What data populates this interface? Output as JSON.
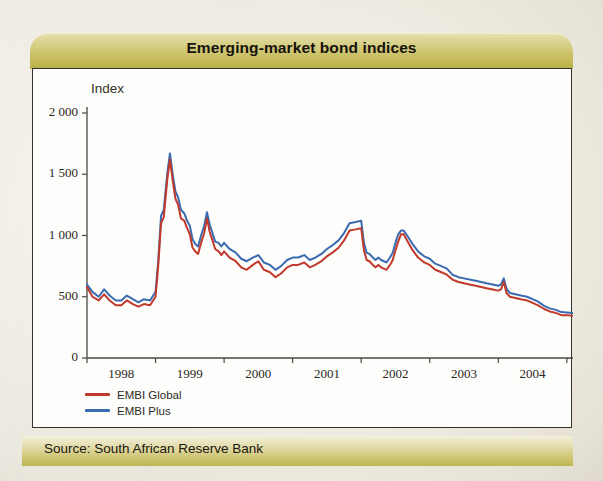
{
  "figure": {
    "title": "Emerging-market bond indices",
    "source": "Source: South African Reserve Bank",
    "index_label": "Index",
    "colors": {
      "title_bar": "#c6bd63",
      "footer_bar": "#d0c678",
      "panel_bg": "#fdfdfb",
      "frame": "#36332b",
      "embi_global": "#c0392b",
      "embi_plus": "#3a6bb0"
    }
  },
  "chart_data": {
    "type": "line",
    "title": "Emerging-market bond indices",
    "xlabel": "",
    "ylabel": "Index",
    "ylim": [
      0,
      2000
    ],
    "yticks": [
      0,
      500,
      1000,
      1500,
      2000
    ],
    "ytick_labels": [
      "0",
      "500",
      "1 000",
      "1 500",
      "2 000"
    ],
    "xlim": [
      1997.58,
      2004.67
    ],
    "xticks": [
      1997.58,
      1998.58,
      1999.58,
      2000.58,
      2001.58,
      2002.58,
      2003.58,
      2004.58
    ],
    "xtick_labels": [
      "1998",
      "1999",
      "2000",
      "2001",
      "2002",
      "2003",
      "2004"
    ],
    "grid": false,
    "legend_position": "bottom-left",
    "series": [
      {
        "name": "EMBI Global",
        "color": "#c0392b",
        "x": [
          1997.58,
          1997.66,
          1997.75,
          1997.83,
          1997.91,
          1998.0,
          1998.08,
          1998.16,
          1998.25,
          1998.33,
          1998.41,
          1998.5,
          1998.58,
          1998.62,
          1998.66,
          1998.7,
          1998.75,
          1998.79,
          1998.83,
          1998.87,
          1998.91,
          1998.95,
          1999.0,
          1999.04,
          1999.08,
          1999.12,
          1999.16,
          1999.2,
          1999.25,
          1999.29,
          1999.33,
          1999.37,
          1999.41,
          1999.45,
          1999.5,
          1999.54,
          1999.58,
          1999.66,
          1999.75,
          1999.83,
          1999.91,
          2000.0,
          2000.08,
          2000.16,
          2000.25,
          2000.33,
          2000.41,
          2000.5,
          2000.58,
          2000.66,
          2000.75,
          2000.83,
          2000.91,
          2001.0,
          2001.08,
          2001.16,
          2001.25,
          2001.33,
          2001.41,
          2001.5,
          2001.58,
          2001.62,
          2001.66,
          2001.7,
          2001.75,
          2001.79,
          2001.83,
          2001.87,
          2001.91,
          2001.95,
          2002.0,
          2002.04,
          2002.08,
          2002.12,
          2002.16,
          2002.2,
          2002.25,
          2002.33,
          2002.41,
          2002.5,
          2002.58,
          2002.66,
          2002.75,
          2002.83,
          2002.91,
          2003.0,
          2003.08,
          2003.16,
          2003.25,
          2003.33,
          2003.41,
          2003.5,
          2003.58,
          2003.62,
          2003.66,
          2003.7,
          2003.75,
          2003.83,
          2003.91,
          2004.0,
          2004.08,
          2004.16,
          2004.25,
          2004.33,
          2004.41,
          2004.5,
          2004.58,
          2004.66
        ],
        "y": [
          580,
          500,
          470,
          520,
          470,
          430,
          430,
          470,
          440,
          420,
          440,
          430,
          500,
          760,
          1100,
          1150,
          1450,
          1620,
          1450,
          1300,
          1250,
          1140,
          1120,
          1060,
          1010,
          900,
          870,
          850,
          950,
          1020,
          1140,
          1030,
          960,
          890,
          870,
          840,
          870,
          820,
          790,
          740,
          720,
          760,
          790,
          720,
          700,
          660,
          690,
          740,
          760,
          760,
          780,
          740,
          760,
          790,
          830,
          860,
          900,
          960,
          1040,
          1050,
          1060,
          880,
          800,
          790,
          760,
          740,
          760,
          740,
          730,
          720,
          760,
          800,
          880,
          950,
          1010,
          1010,
          960,
          880,
          820,
          780,
          760,
          720,
          700,
          680,
          640,
          620,
          610,
          600,
          590,
          580,
          570,
          560,
          550,
          560,
          620,
          530,
          500,
          490,
          480,
          470,
          450,
          430,
          400,
          380,
          370,
          350,
          350,
          345
        ]
      },
      {
        "name": "EMBI Plus",
        "color": "#3a6bb0",
        "x": [
          1997.58,
          1997.66,
          1997.75,
          1997.83,
          1997.91,
          1998.0,
          1998.08,
          1998.16,
          1998.25,
          1998.33,
          1998.41,
          1998.5,
          1998.58,
          1998.62,
          1998.66,
          1998.7,
          1998.75,
          1998.79,
          1998.83,
          1998.87,
          1998.91,
          1998.95,
          1999.0,
          1999.04,
          1999.08,
          1999.12,
          1999.16,
          1999.2,
          1999.25,
          1999.29,
          1999.33,
          1999.37,
          1999.41,
          1999.45,
          1999.5,
          1999.54,
          1999.58,
          1999.66,
          1999.75,
          1999.83,
          1999.91,
          2000.0,
          2000.08,
          2000.16,
          2000.25,
          2000.33,
          2000.41,
          2000.5,
          2000.58,
          2000.66,
          2000.75,
          2000.83,
          2000.91,
          2001.0,
          2001.08,
          2001.16,
          2001.25,
          2001.33,
          2001.41,
          2001.5,
          2001.58,
          2001.62,
          2001.66,
          2001.7,
          2001.75,
          2001.79,
          2001.83,
          2001.87,
          2001.91,
          2001.95,
          2002.0,
          2002.04,
          2002.08,
          2002.12,
          2002.16,
          2002.2,
          2002.25,
          2002.33,
          2002.41,
          2002.5,
          2002.58,
          2002.66,
          2002.75,
          2002.83,
          2002.91,
          2003.0,
          2003.08,
          2003.16,
          2003.25,
          2003.33,
          2003.41,
          2003.5,
          2003.58,
          2003.62,
          2003.66,
          2003.7,
          2003.75,
          2003.83,
          2003.91,
          2004.0,
          2004.08,
          2004.16,
          2004.25,
          2004.33,
          2004.41,
          2004.5,
          2004.58,
          2004.66
        ],
        "y": [
          600,
          540,
          500,
          560,
          510,
          470,
          470,
          510,
          480,
          455,
          480,
          470,
          540,
          800,
          1160,
          1210,
          1500,
          1670,
          1500,
          1360,
          1310,
          1210,
          1180,
          1120,
          1080,
          970,
          930,
          910,
          1010,
          1080,
          1190,
          1090,
          1020,
          950,
          940,
          910,
          940,
          890,
          860,
          810,
          790,
          820,
          840,
          780,
          760,
          720,
          750,
          800,
          820,
          820,
          840,
          800,
          820,
          850,
          890,
          920,
          960,
          1020,
          1100,
          1110,
          1120,
          940,
          860,
          850,
          820,
          800,
          820,
          800,
          790,
          780,
          820,
          860,
          940,
          1010,
          1040,
          1040,
          1000,
          930,
          870,
          830,
          810,
          770,
          750,
          730,
          680,
          660,
          650,
          640,
          630,
          620,
          610,
          600,
          590,
          600,
          650,
          565,
          530,
          520,
          510,
          500,
          480,
          460,
          425,
          405,
          395,
          375,
          372,
          368
        ]
      }
    ]
  }
}
